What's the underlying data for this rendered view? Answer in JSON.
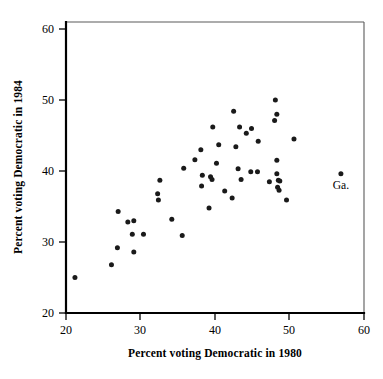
{
  "chart_data": {
    "type": "scatter",
    "title": "",
    "xlabel": "Percent voting Democratic in 1980",
    "ylabel": "Percent voting Democratic in 1984",
    "xlim": [
      20,
      60
    ],
    "ylim": [
      20,
      60
    ],
    "xticks": [
      20,
      30,
      40,
      50,
      60
    ],
    "yticks": [
      20,
      30,
      40,
      50,
      60
    ],
    "xtick_labels": [
      "20",
      "30",
      "40",
      "50",
      "60"
    ],
    "ytick_labels": [
      "20",
      "30",
      "40",
      "50",
      "60"
    ],
    "grid": false,
    "legend": false,
    "marker": "filled-circle",
    "marker_color": "#1a1a1a",
    "points": [
      {
        "x": 21.2,
        "y": 25.0
      },
      {
        "x": 26.1,
        "y": 26.8
      },
      {
        "x": 26.9,
        "y": 29.2
      },
      {
        "x": 27.0,
        "y": 34.3
      },
      {
        "x": 28.3,
        "y": 32.8
      },
      {
        "x": 29.1,
        "y": 33.0
      },
      {
        "x": 28.9,
        "y": 31.1
      },
      {
        "x": 29.1,
        "y": 28.6
      },
      {
        "x": 30.4,
        "y": 31.1
      },
      {
        "x": 32.3,
        "y": 36.8
      },
      {
        "x": 32.4,
        "y": 35.9
      },
      {
        "x": 32.6,
        "y": 38.7
      },
      {
        "x": 34.2,
        "y": 33.2
      },
      {
        "x": 35.6,
        "y": 30.9
      },
      {
        "x": 35.8,
        "y": 40.4
      },
      {
        "x": 37.3,
        "y": 41.6
      },
      {
        "x": 38.1,
        "y": 43.0
      },
      {
        "x": 38.3,
        "y": 39.4
      },
      {
        "x": 38.2,
        "y": 37.9
      },
      {
        "x": 39.2,
        "y": 34.8
      },
      {
        "x": 39.4,
        "y": 39.2
      },
      {
        "x": 39.6,
        "y": 38.8
      },
      {
        "x": 39.7,
        "y": 46.2
      },
      {
        "x": 40.2,
        "y": 41.1
      },
      {
        "x": 40.5,
        "y": 43.7
      },
      {
        "x": 41.3,
        "y": 37.2
      },
      {
        "x": 42.3,
        "y": 36.2
      },
      {
        "x": 42.5,
        "y": 48.4
      },
      {
        "x": 42.8,
        "y": 43.4
      },
      {
        "x": 43.1,
        "y": 40.3
      },
      {
        "x": 43.3,
        "y": 46.2
      },
      {
        "x": 43.5,
        "y": 38.8
      },
      {
        "x": 44.2,
        "y": 45.3
      },
      {
        "x": 44.9,
        "y": 46.0
      },
      {
        "x": 44.8,
        "y": 39.9
      },
      {
        "x": 45.7,
        "y": 39.9
      },
      {
        "x": 45.8,
        "y": 44.2
      },
      {
        "x": 47.3,
        "y": 38.5
      },
      {
        "x": 48.0,
        "y": 47.1
      },
      {
        "x": 48.1,
        "y": 50.0
      },
      {
        "x": 48.3,
        "y": 48.0
      },
      {
        "x": 48.3,
        "y": 41.5
      },
      {
        "x": 48.3,
        "y": 39.6
      },
      {
        "x": 48.5,
        "y": 38.7
      },
      {
        "x": 48.7,
        "y": 38.6
      },
      {
        "x": 48.4,
        "y": 37.7
      },
      {
        "x": 48.6,
        "y": 37.3
      },
      {
        "x": 49.6,
        "y": 35.9
      },
      {
        "x": 50.6,
        "y": 44.5
      },
      {
        "x": 56.9,
        "y": 39.6,
        "label": "Ga."
      }
    ],
    "annotations": [
      {
        "text": "Ga.",
        "x": 56.9,
        "y": 37.4
      }
    ]
  }
}
